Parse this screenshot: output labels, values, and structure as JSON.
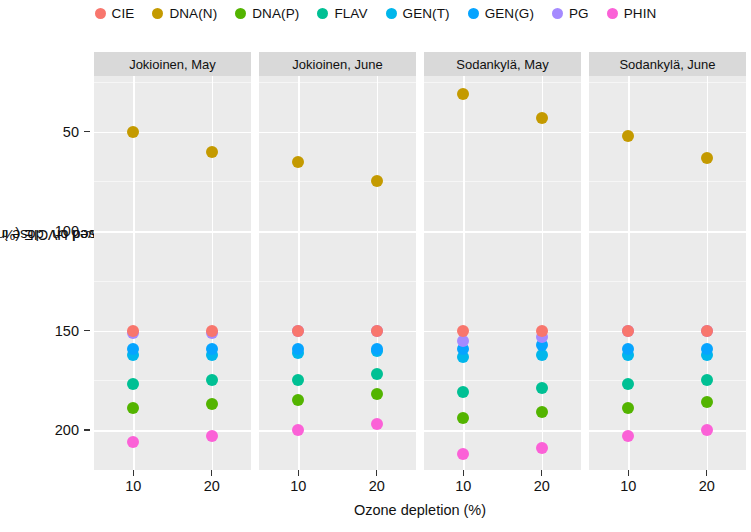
{
  "legend": {
    "position": "top",
    "items": [
      {
        "label": "CIE",
        "color": "#F8766D"
      },
      {
        "label": "DNA(N)",
        "color": "#C49A00"
      },
      {
        "label": "DNA(P)",
        "color": "#53B400"
      },
      {
        "label": "FLAV",
        "color": "#00C094"
      },
      {
        "label": "GEN(T)",
        "color": "#00B6EB"
      },
      {
        "label": "GEN(G)",
        "color": "#06A4FF"
      },
      {
        "label": "PG",
        "color": "#A58AFF"
      },
      {
        "label": "PHIN",
        "color": "#FB61D7"
      }
    ]
  },
  "axes": {
    "ylabel": "Achieved UV dose increase when lamps set based on CIE (% of target)",
    "ylabel_line1": "Achieved UV dose increase when lamps",
    "ylabel_line2": "set based on CIE (% of target)",
    "xlabel": "Ozone depletion (%)",
    "yticks": [
      "200",
      "150",
      "100",
      "50"
    ],
    "xticks": [
      "10",
      "20"
    ]
  },
  "chart_data": {
    "type": "scatter",
    "title": "",
    "xlabel": "Ozone depletion (%)",
    "ylabel": "Achieved UV dose increase when lamps set based on CIE (% of target)",
    "x": [
      10,
      20
    ],
    "xlim": [
      5,
      25
    ],
    "ylim": [
      30,
      228
    ],
    "yticks": [
      50,
      100,
      150,
      200
    ],
    "grid": true,
    "legend_position": "top",
    "facet_variable": "site_month",
    "facets": [
      {
        "name": "Jokioinen, May",
        "series": [
          {
            "name": "CIE",
            "color": "#F8766D",
            "values": [
              100,
              100
            ]
          },
          {
            "name": "DNA(N)",
            "color": "#C49A00",
            "values": [
              200,
              190
            ]
          },
          {
            "name": "DNA(P)",
            "color": "#53B400",
            "values": [
              61,
              63
            ]
          },
          {
            "name": "FLAV",
            "color": "#00C094",
            "values": [
              73,
              75
            ]
          },
          {
            "name": "GEN(T)",
            "color": "#00B6EB",
            "values": [
              88,
              88
            ]
          },
          {
            "name": "GEN(G)",
            "color": "#06A4FF",
            "values": [
              91,
              91
            ]
          },
          {
            "name": "PG",
            "color": "#A58AFF",
            "values": [
              99,
              99
            ]
          },
          {
            "name": "PHIN",
            "color": "#FB61D7",
            "values": [
              44,
              47
            ]
          }
        ]
      },
      {
        "name": "Jokioinen, June",
        "series": [
          {
            "name": "CIE",
            "color": "#F8766D",
            "values": [
              100,
              100
            ]
          },
          {
            "name": "DNA(N)",
            "color": "#C49A00",
            "values": [
              185,
              175
            ]
          },
          {
            "name": "DNA(P)",
            "color": "#53B400",
            "values": [
              65,
              68
            ]
          },
          {
            "name": "FLAV",
            "color": "#00C094",
            "values": [
              75,
              78
            ]
          },
          {
            "name": "GEN(T)",
            "color": "#00B6EB",
            "values": [
              89,
              90
            ]
          },
          {
            "name": "GEN(G)",
            "color": "#06A4FF",
            "values": [
              91,
              91
            ]
          },
          {
            "name": "PG",
            "color": "#A58AFF",
            "values": [
              100,
              100
            ]
          },
          {
            "name": "PHIN",
            "color": "#FB61D7",
            "values": [
              50,
              53
            ]
          }
        ]
      },
      {
        "name": "Sodankylä, May",
        "series": [
          {
            "name": "CIE",
            "color": "#F8766D",
            "values": [
              100,
              100
            ]
          },
          {
            "name": "DNA(N)",
            "color": "#C49A00",
            "values": [
              219,
              207
            ]
          },
          {
            "name": "DNA(P)",
            "color": "#53B400",
            "values": [
              56,
              59
            ]
          },
          {
            "name": "FLAV",
            "color": "#00C094",
            "values": [
              69,
              71
            ]
          },
          {
            "name": "GEN(T)",
            "color": "#00B6EB",
            "values": [
              87,
              88
            ]
          },
          {
            "name": "GEN(G)",
            "color": "#06A4FF",
            "values": [
              91,
              93
            ]
          },
          {
            "name": "PG",
            "color": "#A58AFF",
            "values": [
              95,
              97
            ]
          },
          {
            "name": "PHIN",
            "color": "#FB61D7",
            "values": [
              38,
              41
            ]
          }
        ]
      },
      {
        "name": "Sodankylä, June",
        "series": [
          {
            "name": "CIE",
            "color": "#F8766D",
            "values": [
              100,
              100
            ]
          },
          {
            "name": "DNA(N)",
            "color": "#C49A00",
            "values": [
              198,
              187
            ]
          },
          {
            "name": "DNA(P)",
            "color": "#53B400",
            "values": [
              61,
              64
            ]
          },
          {
            "name": "FLAV",
            "color": "#00C094",
            "values": [
              73,
              75
            ]
          },
          {
            "name": "GEN(T)",
            "color": "#00B6EB",
            "values": [
              88,
              88
            ]
          },
          {
            "name": "GEN(G)",
            "color": "#06A4FF",
            "values": [
              91,
              91
            ]
          },
          {
            "name": "PG",
            "color": "#A58AFF",
            "values": [
              100,
              100
            ]
          },
          {
            "name": "PHIN",
            "color": "#FB61D7",
            "values": [
              47,
              50
            ]
          }
        ]
      }
    ]
  }
}
